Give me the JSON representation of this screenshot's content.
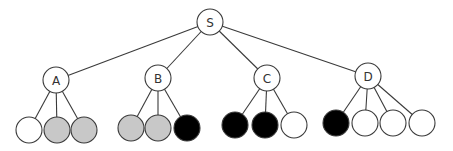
{
  "diagram": {
    "type": "tree",
    "width": 453,
    "height": 151,
    "colors": {
      "stroke": "#3a3a3a",
      "white": "#ffffff",
      "gray": "#c8c8c8",
      "black": "#000000"
    },
    "root": {
      "id": "S",
      "label": "S",
      "x": 210,
      "y": 22,
      "r": 13
    },
    "internal_nodes": [
      {
        "id": "A",
        "label": "A",
        "x": 56,
        "y": 80,
        "r": 13
      },
      {
        "id": "B",
        "label": "B",
        "x": 158,
        "y": 78,
        "r": 13
      },
      {
        "id": "C",
        "label": "C",
        "x": 267,
        "y": 78,
        "r": 13
      },
      {
        "id": "D",
        "label": "D",
        "x": 368,
        "y": 76,
        "r": 13
      }
    ],
    "leaves": [
      {
        "parent": "A",
        "fill": "white",
        "x": 29,
        "y": 130,
        "r": 13
      },
      {
        "parent": "A",
        "fill": "gray",
        "x": 57,
        "y": 130,
        "r": 13
      },
      {
        "parent": "A",
        "fill": "gray",
        "x": 84,
        "y": 130,
        "r": 13
      },
      {
        "parent": "B",
        "fill": "gray",
        "x": 131,
        "y": 128,
        "r": 13
      },
      {
        "parent": "B",
        "fill": "gray",
        "x": 158,
        "y": 128,
        "r": 13
      },
      {
        "parent": "B",
        "fill": "black",
        "x": 187,
        "y": 128,
        "r": 13
      },
      {
        "parent": "C",
        "fill": "black",
        "x": 235,
        "y": 125,
        "r": 13
      },
      {
        "parent": "C",
        "fill": "black",
        "x": 265,
        "y": 125,
        "r": 13
      },
      {
        "parent": "C",
        "fill": "white",
        "x": 294,
        "y": 125,
        "r": 13
      },
      {
        "parent": "D",
        "fill": "black",
        "x": 336,
        "y": 123,
        "r": 13
      },
      {
        "parent": "D",
        "fill": "white",
        "x": 365,
        "y": 123,
        "r": 13
      },
      {
        "parent": "D",
        "fill": "white",
        "x": 393,
        "y": 123,
        "r": 13
      },
      {
        "parent": "D",
        "fill": "white",
        "x": 422,
        "y": 123,
        "r": 13
      }
    ]
  }
}
